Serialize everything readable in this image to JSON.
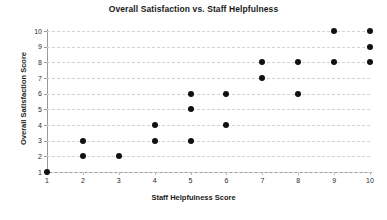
{
  "chart_data": {
    "type": "scatter",
    "title": "Overall Satisfaction vs. Staff Helpfulness",
    "xlabel": "Staff Helpfulness Score",
    "ylabel": "Overall Satisfaction Score",
    "xlim": [
      1,
      10
    ],
    "ylim": [
      1,
      10
    ],
    "xticks": [
      1,
      2,
      3,
      4,
      5,
      6,
      7,
      8,
      9,
      10
    ],
    "yticks": [
      1,
      2,
      3,
      4,
      5,
      6,
      7,
      8,
      9,
      10
    ],
    "xtick_labels": [
      "1",
      "2",
      "3",
      "4",
      "5",
      "6",
      "7",
      "8",
      "9",
      "10"
    ],
    "ytick_labels": [
      "1",
      "2",
      "3",
      "4",
      "5",
      "6",
      "7",
      "8",
      "9",
      "10"
    ],
    "grid": true,
    "grid_axis": "y",
    "grid_style": "dashed",
    "legend": false,
    "marker_color": "#111111",
    "grid_color": "#d2d2d6",
    "axis_color": "#9a9a9e",
    "background": "#ffffff",
    "points": [
      {
        "x": 1,
        "y": 1
      },
      {
        "x": 2,
        "y": 2
      },
      {
        "x": 2,
        "y": 3
      },
      {
        "x": 3,
        "y": 2
      },
      {
        "x": 4,
        "y": 3
      },
      {
        "x": 4,
        "y": 4
      },
      {
        "x": 5,
        "y": 3
      },
      {
        "x": 5,
        "y": 5
      },
      {
        "x": 5,
        "y": 6
      },
      {
        "x": 6,
        "y": 4
      },
      {
        "x": 6,
        "y": 6
      },
      {
        "x": 7,
        "y": 7
      },
      {
        "x": 7,
        "y": 8
      },
      {
        "x": 8,
        "y": 6
      },
      {
        "x": 8,
        "y": 8
      },
      {
        "x": 9,
        "y": 8
      },
      {
        "x": 9,
        "y": 10
      },
      {
        "x": 10,
        "y": 8
      },
      {
        "x": 10,
        "y": 9
      },
      {
        "x": 10,
        "y": 10
      }
    ],
    "x": [
      1,
      2,
      2,
      3,
      4,
      4,
      5,
      5,
      5,
      6,
      6,
      7,
      7,
      8,
      8,
      9,
      9,
      10,
      10,
      10
    ],
    "y": [
      1,
      2,
      3,
      2,
      3,
      4,
      3,
      5,
      6,
      4,
      6,
      7,
      8,
      6,
      8,
      8,
      10,
      8,
      9,
      10
    ]
  }
}
